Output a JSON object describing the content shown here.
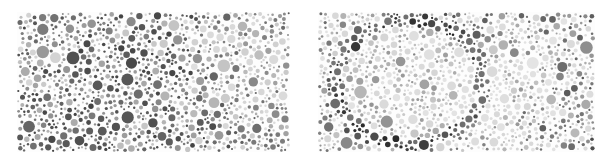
{
  "figure": {
    "type": "dot-plate-pair",
    "caption": "",
    "background_color": "#ffffff",
    "width": 609,
    "height": 163
  },
  "panels": [
    {
      "id": "panel-left",
      "label": "",
      "kind": "uniform-random-dots",
      "x": 17,
      "y": 12,
      "width": 273,
      "height": 140,
      "hidden_pattern": "none",
      "description": "Dense field of randomly placed grayscale dots of varying radius; no embedded figure.",
      "dot_count_estimate": 1150,
      "radius_range_px": [
        1.0,
        6.5
      ],
      "gray_levels": [
        "#4a4a4a",
        "#5a5a5a",
        "#6b6b6b",
        "#7d7d7d",
        "#8e8e8e",
        "#a0a0a0",
        "#b2b2b2",
        "#c4c4c4",
        "#d6d6d6"
      ]
    },
    {
      "id": "panel-right",
      "label": "",
      "kind": "patterned-dots",
      "x": 318,
      "y": 12,
      "width": 277,
      "height": 140,
      "hidden_pattern": "embedded-blob",
      "description": "Dense field of randomly placed grayscale dots with an embedded lighter region in the left-of-center area bordered by darker dots, forming a faint hidden shape.",
      "dot_count_estimate": 1150,
      "radius_range_px": [
        1.0,
        6.5
      ],
      "gray_levels": [
        "#2c2c2c",
        "#3c3c3c",
        "#4e4e4e",
        "#606060",
        "#737373",
        "#878787",
        "#9b9b9b",
        "#b0b0b0",
        "#c6c6c6",
        "#dcdcdc"
      ],
      "pattern_region": {
        "cx": 0.33,
        "cy": 0.5,
        "rx": 0.24,
        "ry": 0.4
      }
    }
  ],
  "chart_data": {
    "type": "scatter",
    "title": "",
    "xlabel": "",
    "ylabel": "",
    "grid": false,
    "legend": "none",
    "xlim": [
      0,
      1
    ],
    "ylim": [
      0,
      1
    ],
    "series": [
      {
        "name": "left-panel-dots",
        "marker": "circle",
        "n": 1150,
        "size_range": [
          1.0,
          6.5
        ],
        "color_scale": "grayscale-uniform",
        "spatial_distribution": "poisson-disk-uniform"
      },
      {
        "name": "right-panel-dots",
        "marker": "circle",
        "n": 1150,
        "size_range": [
          1.0,
          6.5
        ],
        "color_scale": "grayscale-modulated",
        "spatial_distribution": "poisson-disk-uniform",
        "luminance_field": "lighter-inside-embedded-blob"
      }
    ]
  }
}
